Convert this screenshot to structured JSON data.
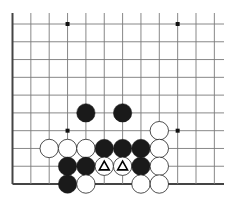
{
  "caption": {
    "text": "",
    "note": "partially cropped faint text at top edge, illegible"
  },
  "board": {
    "title": "Go problem diagram (bottom-left corner region)",
    "colors": {
      "background": "#ffffff",
      "line": "#7a7a7a",
      "edge": "#444444",
      "black_stone": "#1a1a1a",
      "white_stone": "#ffffff",
      "stone_outline": "#222222",
      "star": "#111111",
      "marker": "#000000"
    },
    "grid": {
      "origin_x": 12.5,
      "origin_y": 24,
      "col_spacing": 18.35,
      "row_spacing": 17.78,
      "cols": 12,
      "rows": 10,
      "line_top_y": 13,
      "line_right_x": 224,
      "left_edge": true,
      "bottom_edge": true
    },
    "star_points": [
      {
        "col": 3,
        "row": 0
      },
      {
        "col": 9,
        "row": 0
      },
      {
        "col": 3,
        "row": 6
      },
      {
        "col": 9,
        "row": 6
      }
    ],
    "stones": [
      {
        "color": "black",
        "col": 4,
        "row": 5
      },
      {
        "color": "black",
        "col": 6,
        "row": 5
      },
      {
        "color": "white",
        "col": 8,
        "row": 6
      },
      {
        "color": "white",
        "col": 2,
        "row": 7
      },
      {
        "color": "white",
        "col": 3,
        "row": 7
      },
      {
        "color": "white",
        "col": 4,
        "row": 7
      },
      {
        "color": "black",
        "col": 5,
        "row": 7
      },
      {
        "color": "black",
        "col": 6,
        "row": 7
      },
      {
        "color": "black",
        "col": 7,
        "row": 7
      },
      {
        "color": "white",
        "col": 8,
        "row": 7
      },
      {
        "color": "black",
        "col": 3,
        "row": 8
      },
      {
        "color": "black",
        "col": 4,
        "row": 8
      },
      {
        "color": "white",
        "col": 5,
        "row": 8,
        "marker": "triangle"
      },
      {
        "color": "white",
        "col": 6,
        "row": 8,
        "marker": "triangle"
      },
      {
        "color": "black",
        "col": 7,
        "row": 8
      },
      {
        "color": "white",
        "col": 8,
        "row": 8
      },
      {
        "color": "black",
        "col": 3,
        "row": 9
      },
      {
        "color": "white",
        "col": 4,
        "row": 9
      },
      {
        "color": "white",
        "col": 7,
        "row": 9
      },
      {
        "color": "white",
        "col": 8,
        "row": 9
      }
    ],
    "stone_radius": 9.2
  }
}
